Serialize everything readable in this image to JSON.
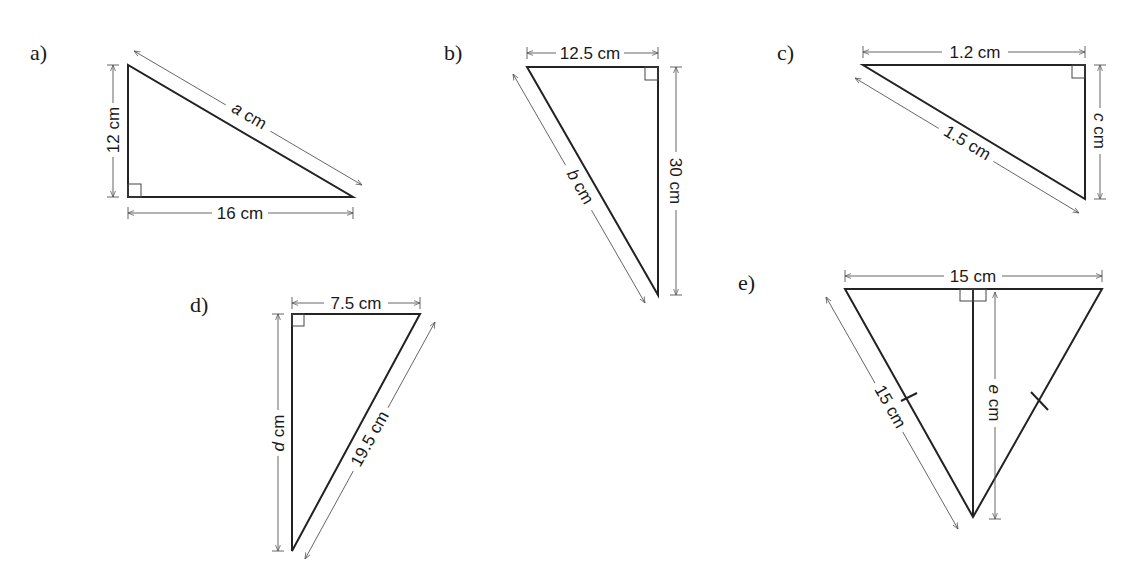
{
  "diagram": {
    "type": "right-triangle-exercises",
    "problems": [
      {
        "id": "a",
        "label": "a)",
        "sides": {
          "vertical": "12 cm",
          "horizontal": "16 cm",
          "hypotenuse": "a cm"
        },
        "unknown": "a"
      },
      {
        "id": "b",
        "label": "b)",
        "sides": {
          "top": "12.5 cm",
          "vertical": "30 cm",
          "hypotenuse": "b cm"
        },
        "unknown": "b"
      },
      {
        "id": "c",
        "label": "c)",
        "sides": {
          "top": "1.2 cm",
          "vertical": "c cm",
          "hypotenuse": "1.5 cm"
        },
        "unknown": "c"
      },
      {
        "id": "d",
        "label": "d)",
        "sides": {
          "top": "7.5 cm",
          "vertical": "d cm",
          "hypotenuse": "19.5 cm"
        },
        "unknown": "d"
      },
      {
        "id": "e",
        "label": "e)",
        "sides": {
          "top": "15 cm",
          "slant": "15 cm",
          "altitude": "e cm"
        },
        "unknown": "e",
        "note": "equilateral triangle with altitude"
      }
    ]
  },
  "labels": {
    "a": "a)",
    "b": "b)",
    "c": "c)",
    "d": "d)",
    "e": "e)"
  },
  "dims": {
    "a_vert": "12 cm",
    "a_hor": "16 cm",
    "a_hyp_var": "a",
    "a_hyp_unit": " cm",
    "b_top": "12.5 cm",
    "b_vert": "30 cm",
    "b_hyp_var": "b",
    "b_hyp_unit": " cm",
    "c_top": "1.2 cm",
    "c_vert_var": "c",
    "c_vert_unit": " cm",
    "c_hyp": "1.5 cm",
    "d_top": "7.5 cm",
    "d_vert_var": "d",
    "d_vert_unit": " cm",
    "d_hyp": "19.5 cm",
    "e_top": "15 cm",
    "e_slant": "15 cm",
    "e_alt_var": "e",
    "e_alt_unit": " cm"
  }
}
